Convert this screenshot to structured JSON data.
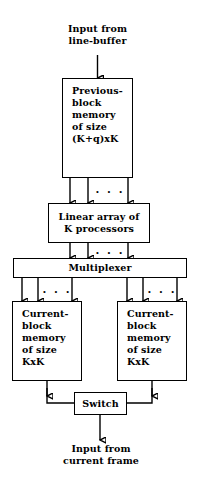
{
  "diagram": {
    "stroke_color": "#000000",
    "background_color": "#ffffff",
    "labels": {
      "input_top": "Input from\nline-buffer",
      "input_bottom": "Input from\ncurrent frame"
    },
    "nodes": {
      "previous_block_memory": "Previous-\nblock\nmemory\nof size\n(K+q)xK",
      "linear_array": "Linear array of\nK processors",
      "multiplexer": "Multiplexer",
      "current_block_memory_left": "Current-\nblock\nmemory\nof size\nKxK",
      "current_block_memory_right": "Current-\nblock\nmemory\nof size\nKxK",
      "switch": "Switch"
    },
    "ellipses": {
      "prev_to_linear": ". . .",
      "mux_to_linear": ". . .",
      "left_mem_to_mux": ". . .",
      "right_mem_to_mux": ". . ."
    }
  }
}
